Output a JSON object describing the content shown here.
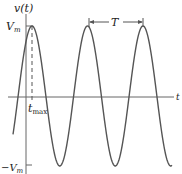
{
  "diagram": {
    "type": "sinusoid",
    "y_axis_label": "v(t)",
    "x_axis_label": "t",
    "peak_label": "V",
    "peak_sub": "m",
    "neg_peak_label": "−V",
    "neg_peak_sub": "m",
    "tmax_label": "t",
    "tmax_sub": "max",
    "period_label": "T",
    "colors": {
      "curve": "#555555",
      "axes": "#666666",
      "text": "#222222"
    }
  },
  "chart_data": {
    "type": "line",
    "title": "",
    "xlabel": "t",
    "ylabel": "v(t)",
    "y_ticks": [
      "V_m",
      "-V_m"
    ],
    "annotations": [
      "t_max",
      "T (period, peak to peak)"
    ],
    "periods_shown": 3
  }
}
